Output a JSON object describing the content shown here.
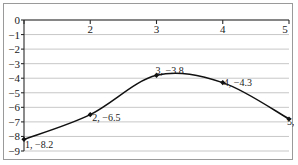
{
  "chart_data": {
    "type": "line",
    "title": "",
    "xlabel": "",
    "ylabel": "",
    "x": [
      1,
      2,
      3,
      4,
      5
    ],
    "values": [
      -8.2,
      -6.5,
      -3.8,
      -4.3,
      -6.8
    ],
    "series": [
      {
        "name": "",
        "x": [
          1,
          2,
          3,
          4,
          5
        ],
        "values": [
          -8.2,
          -6.5,
          -3.8,
          -4.3,
          -6.8
        ]
      }
    ],
    "point_labels": [
      "1, −8.2",
      "2, −6.5",
      "3, −3.8",
      "4, −4.3",
      "5, −6.8"
    ],
    "xlim": [
      1,
      5
    ],
    "ylim": [
      -9,
      0
    ],
    "xticks": [
      1,
      2,
      3,
      4,
      5
    ],
    "xtick_labels": [
      "",
      "2",
      "3",
      "4",
      "5"
    ],
    "yticks": [
      0,
      -1,
      -2,
      -3,
      -4,
      -5,
      -6,
      -7,
      -8,
      -9
    ],
    "ytick_labels": [
      "0",
      "−1",
      "−2",
      "−3",
      "−4",
      "−5",
      "−6",
      "−7",
      "−8",
      "−9"
    ],
    "grid": true,
    "grid_axis": "y",
    "legend": false,
    "xaxis_position": "top",
    "marker": "diamond",
    "line_color": "#111111",
    "grid_color": "#b9b9b9",
    "axis_color": "#2b2b2b"
  }
}
